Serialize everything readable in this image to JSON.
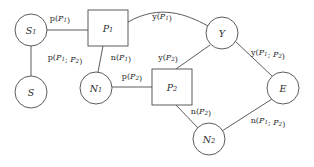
{
  "diagram": {
    "type": "graph",
    "background_color": "#ffffff",
    "stroke_color": "#4a4a4a",
    "text_color": "#2b2b2b",
    "nodes": [
      {
        "id": "S1",
        "label": "S",
        "subscript": "1",
        "shape": "circle",
        "cx": 31,
        "cy": 30,
        "r": 16
      },
      {
        "id": "P1",
        "label": "P",
        "subscript": "1",
        "shape": "square",
        "x": 88,
        "y": 10,
        "w": 40,
        "h": 36
      },
      {
        "id": "Y",
        "label": "Y",
        "subscript": "",
        "shape": "circle",
        "cx": 222,
        "cy": 33,
        "r": 16
      },
      {
        "id": "S",
        "label": "S",
        "subscript": "",
        "shape": "circle",
        "cx": 31,
        "cy": 92,
        "r": 16
      },
      {
        "id": "N1",
        "label": "N",
        "subscript": "1",
        "shape": "circle",
        "cx": 96,
        "cy": 88,
        "r": 16
      },
      {
        "id": "P2",
        "label": "P",
        "subscript": "2",
        "shape": "square",
        "x": 152,
        "y": 69,
        "w": 40,
        "h": 36
      },
      {
        "id": "E",
        "label": "E",
        "subscript": "",
        "shape": "circle",
        "cx": 283,
        "cy": 88,
        "r": 16
      },
      {
        "id": "N2",
        "label": "N",
        "subscript": "2",
        "shape": "circle",
        "cx": 209,
        "cy": 139,
        "r": 16
      }
    ],
    "edges": [
      {
        "id": "S1-P1",
        "from": "S1",
        "to": "P1",
        "style": "straight",
        "label": {
          "fn": "p",
          "args": [
            {
              "base": "P",
              "sub": "1"
            }
          ],
          "text": "p(P1)",
          "x": 60,
          "y": 18
        }
      },
      {
        "id": "P1-Y",
        "from": "P1",
        "to": "Y",
        "style": "curved",
        "label": {
          "fn": "y",
          "args": [
            {
              "base": "P",
              "sub": "1"
            }
          ],
          "text": "y(P1)",
          "x": 162,
          "y": 16
        }
      },
      {
        "id": "S1-S",
        "from": "S1",
        "to": "S",
        "style": "straight",
        "label": {
          "fn": "p",
          "args": [
            {
              "base": "P",
              "sub": "1"
            },
            {
              "base": "P",
              "sub": "2"
            }
          ],
          "text": "p(P1; P2)",
          "x": 65,
          "y": 57
        }
      },
      {
        "id": "P1-N1",
        "from": "P1",
        "to": "N1",
        "style": "straight",
        "label": {
          "fn": "n",
          "args": [
            {
              "base": "P",
              "sub": "1"
            }
          ],
          "text": "n(P1)",
          "x": 121,
          "y": 57
        }
      },
      {
        "id": "N1-P2",
        "from": "N1",
        "to": "P2",
        "style": "straight",
        "label": {
          "fn": "p",
          "args": [
            {
              "base": "P",
              "sub": "2"
            }
          ],
          "text": "p(P2)",
          "x": 132,
          "y": 76
        }
      },
      {
        "id": "P2-Y",
        "from": "P2",
        "to": "Y",
        "style": "straight",
        "label": {
          "fn": "y",
          "args": [
            {
              "base": "P",
              "sub": "2"
            }
          ],
          "text": "y(P2)",
          "x": 168,
          "y": 57
        }
      },
      {
        "id": "Y-E",
        "from": "Y",
        "to": "E",
        "style": "straight",
        "label": {
          "fn": "y",
          "args": [
            {
              "base": "P",
              "sub": "1"
            },
            {
              "base": "P",
              "sub": "2"
            }
          ],
          "text": "y(P1; P2)",
          "x": 268,
          "y": 52
        }
      },
      {
        "id": "P2-N2",
        "from": "P2",
        "to": "N2",
        "style": "straight",
        "label": {
          "fn": "n",
          "args": [
            {
              "base": "P",
              "sub": "2"
            }
          ],
          "text": "n(P2)",
          "x": 201,
          "y": 111
        }
      },
      {
        "id": "N2-E",
        "from": "N2",
        "to": "E",
        "style": "straight",
        "label": {
          "fn": "n",
          "args": [
            {
              "base": "P",
              "sub": "1"
            },
            {
              "base": "P",
              "sub": "2"
            }
          ],
          "text": "n(P1; P2)",
          "x": 268,
          "y": 120
        }
      }
    ]
  }
}
